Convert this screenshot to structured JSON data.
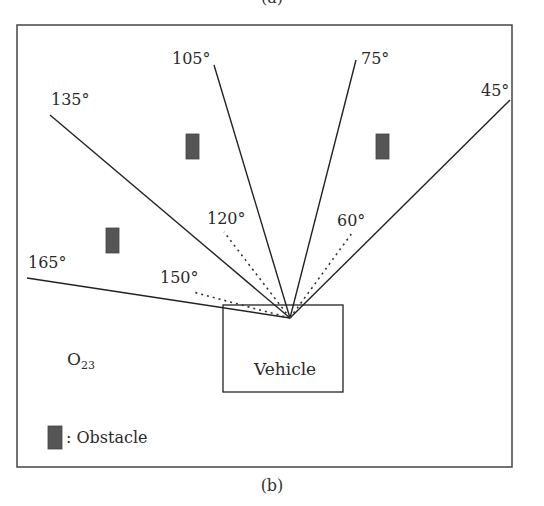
{
  "top_caption": "(a)",
  "bottom_caption": "(b)",
  "colors": {
    "line": "#222222",
    "obstacle": "#555555",
    "frame": "#444444"
  },
  "figure": {
    "vehicle_label": "Vehicle",
    "region_label": {
      "main": "O",
      "subscript": "23"
    },
    "legend": {
      "label": ": Obstacle"
    },
    "solid_rays": [
      {
        "angle": "165°"
      },
      {
        "angle": "135°"
      },
      {
        "angle": "105°"
      },
      {
        "angle": "75°"
      },
      {
        "angle": "45°"
      }
    ],
    "dotted_rays": [
      {
        "angle": "150°"
      },
      {
        "angle": "120°"
      },
      {
        "angle": "60°"
      }
    ],
    "obstacles": 3
  }
}
